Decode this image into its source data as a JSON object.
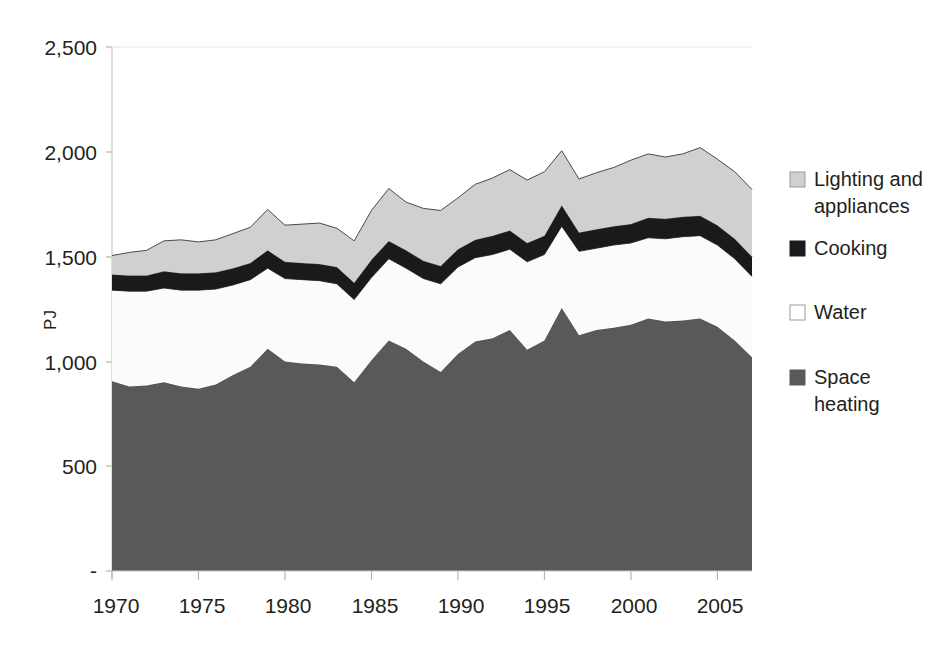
{
  "chart_data": {
    "type": "area",
    "title": "",
    "subtitle": "",
    "xlabel": "",
    "ylabel": "PJ",
    "stacked": true,
    "grid": false,
    "legend_position": "right",
    "xlim": [
      1970,
      2007
    ],
    "ylim": [
      0,
      2500
    ],
    "x": [
      1970,
      1971,
      1972,
      1973,
      1974,
      1975,
      1976,
      1977,
      1978,
      1979,
      1980,
      1981,
      1982,
      1983,
      1984,
      1985,
      1986,
      1987,
      1988,
      1989,
      1990,
      1991,
      1992,
      1993,
      1994,
      1995,
      1996,
      1997,
      1998,
      1999,
      2000,
      2001,
      2002,
      2003,
      2004,
      2005,
      2006,
      2007
    ],
    "xtick_labels": [
      "1970",
      "1975",
      "1980",
      "1985",
      "1990",
      "1995",
      "2000",
      "2005"
    ],
    "xticks": [
      1970,
      1975,
      1980,
      1985,
      1990,
      1995,
      2000,
      2005
    ],
    "ytick_labels": [
      "-",
      "500",
      "1,000",
      "1,500",
      "2,000",
      "2,500"
    ],
    "yticks": [
      0,
      500,
      1000,
      1500,
      2000,
      2500
    ],
    "series": [
      {
        "name": "Space heating",
        "color": "#59595a",
        "values": [
          905,
          880,
          885,
          900,
          880,
          870,
          890,
          935,
          975,
          1060,
          1000,
          990,
          985,
          975,
          900,
          1005,
          1100,
          1060,
          1000,
          950,
          1035,
          1095,
          1110,
          1150,
          1055,
          1100,
          1255,
          1125,
          1150,
          1160,
          1175,
          1205,
          1190,
          1195,
          1205,
          1165,
          1100,
          1020
        ]
      },
      {
        "name": "Water",
        "color": "#fbfbfb",
        "values": [
          435,
          455,
          450,
          450,
          460,
          470,
          455,
          430,
          415,
          385,
          395,
          400,
          400,
          395,
          395,
          395,
          390,
          385,
          395,
          420,
          415,
          400,
          400,
          385,
          420,
          410,
          390,
          400,
          390,
          395,
          390,
          385,
          395,
          400,
          395,
          390,
          390,
          385
        ]
      },
      {
        "name": "Cooking",
        "color": "#1a1a1a",
        "values": [
          75,
          75,
          75,
          80,
          80,
          80,
          80,
          80,
          80,
          85,
          80,
          80,
          80,
          80,
          80,
          85,
          85,
          85,
          85,
          85,
          85,
          85,
          90,
          90,
          90,
          90,
          100,
          90,
          90,
          90,
          90,
          95,
          95,
          95,
          95,
          95,
          95,
          95
        ]
      },
      {
        "name": "Lighting and appliances",
        "color": "#d0d0d0",
        "values": [
          90,
          110,
          120,
          145,
          160,
          150,
          155,
          165,
          170,
          195,
          175,
          185,
          195,
          185,
          200,
          235,
          250,
          230,
          250,
          265,
          245,
          265,
          275,
          290,
          300,
          305,
          260,
          255,
          270,
          280,
          305,
          305,
          295,
          300,
          325,
          315,
          320,
          320
        ]
      }
    ],
    "legend": [
      {
        "label": "Lighting and appliances",
        "color": "#d0d0d0",
        "swatch": "filled"
      },
      {
        "label": "Cooking",
        "color": "#1a1a1a",
        "swatch": "filled"
      },
      {
        "label": "Water",
        "color": "#ffffff",
        "swatch": "outline"
      },
      {
        "label": "Space heating",
        "color": "#59595a",
        "swatch": "filled"
      }
    ]
  },
  "legend_text": {
    "item0_line1": "Lighting and",
    "item0_line2": "appliances",
    "item1_line1": "Cooking",
    "item2_line1": "Water",
    "item3_line1": "Space",
    "item3_line2": "heating"
  },
  "axis": {
    "y_title": "PJ",
    "y_labels": {
      "t2500": "2,500",
      "t2000": "2,000",
      "t1500": "1,500",
      "t1000": "1,000",
      "t500": "500",
      "t0": "-"
    },
    "x_labels": {
      "x1970": "1970",
      "x1975": "1975",
      "x1980": "1980",
      "x1985": "1985",
      "x1990": "1990",
      "x1995": "1995",
      "x2000": "2000",
      "x2005": "2005"
    }
  }
}
